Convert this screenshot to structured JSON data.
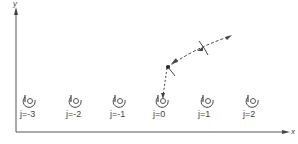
{
  "axes": {
    "x_label": "x",
    "y_label": "y"
  },
  "sites": [
    {
      "label": "j=-3",
      "x": 30
    },
    {
      "label": "j=-2",
      "x": 76
    },
    {
      "label": "j=-1",
      "x": 120
    },
    {
      "label": "j=0",
      "x": 163
    },
    {
      "label": "j=1",
      "x": 208
    },
    {
      "label": "j=2",
      "x": 253
    }
  ],
  "trajectory": {
    "description": "incoming particle path curving toward site j=0",
    "points": [
      [
        228,
        37
      ],
      [
        205,
        47
      ],
      [
        185,
        56
      ],
      [
        168,
        67
      ],
      [
        164,
        80
      ],
      [
        163,
        97
      ]
    ]
  },
  "colors": {
    "line": "#444444",
    "background": "#ffffff"
  }
}
